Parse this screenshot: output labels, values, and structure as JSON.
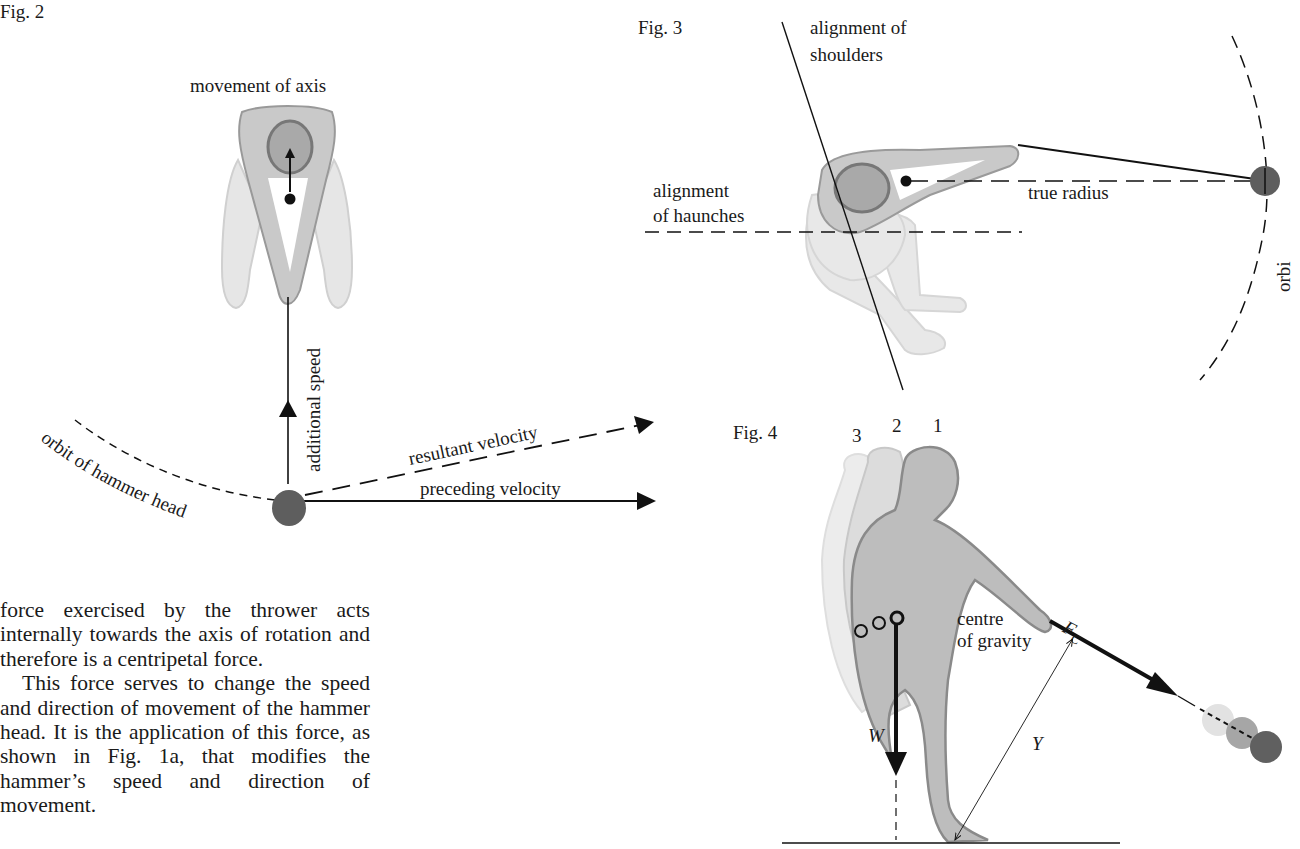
{
  "figures": {
    "fig2": {
      "label": "Fig. 2",
      "labels": {
        "movement_of_axis": "movement of axis",
        "additional_speed": "additional speed",
        "resultant_velocity": "resultant velocity",
        "preceding_velocity": "preceding velocity",
        "orbit_of_hammer_head": "orbit of hammer head"
      }
    },
    "fig3": {
      "label": "Fig. 3",
      "labels": {
        "alignment_of_shoulders_line1": "alignment of",
        "alignment_of_shoulders_line2": "shoulders",
        "alignment_of_haunches_line1": "alignment",
        "alignment_of_haunches_line2": "of haunches",
        "true_radius": "true radius",
        "orbit_partial": "orbi"
      }
    },
    "fig4": {
      "label": "Fig. 4",
      "positions": [
        "3",
        "2",
        "1"
      ],
      "labels": {
        "centre_of_gravity_line1": "centre",
        "centre_of_gravity_line2": "of gravity",
        "force_symbol": "F",
        "force_subscript": "C",
        "weight_symbol": "W",
        "distance_symbol": "Y"
      }
    }
  },
  "body_text": {
    "paragraphs": [
      "force exercised by the thrower acts internally towards the axis of rotation and therefore is a centripetal force.",
      "This force serves to change the speed and direction of movement of the hammer head. It is the application of this force, as shown in Fig. 1a, that modifies the hammer’s speed and direction of movement."
    ]
  },
  "colors": {
    "figure_light": "#e4e4e4",
    "figure_mid": "#c8c8c8",
    "figure_outline": "#8a8a8a",
    "head_fill": "#a9a9a9",
    "hammer_ball": "#5e5e5e",
    "ink": "#111111"
  }
}
